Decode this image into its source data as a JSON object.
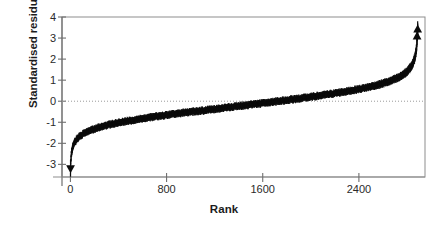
{
  "chart_data": {
    "type": "scatter",
    "title": "",
    "xlabel": "Rank",
    "ylabel": "Standardised residual",
    "xlim": [
      -70,
      2950
    ],
    "ylim": [
      -3.6,
      4.0
    ],
    "xticks": [
      0,
      800,
      1600,
      2400
    ],
    "xtick_labels": [
      "0",
      "800",
      "1600",
      "2400"
    ],
    "yticks": [
      4,
      3,
      2,
      1,
      0,
      -1,
      -2,
      -3
    ],
    "ytick_labels": [
      "4",
      "3",
      "2",
      "1",
      "0",
      "-1",
      "-2",
      "-3"
    ],
    "grid": false,
    "reference_line": {
      "y": 0,
      "style": "dotted",
      "color": "#9a9a9a"
    },
    "frame_color": "#8d8d8d",
    "marker_color": "#0b0b0b",
    "n_points": 2890,
    "series": [
      {
        "name": "Standardised residual",
        "marker": "point-with-error-bar",
        "x": [
          1,
          5,
          12,
          22,
          35,
          55,
          80,
          115,
          160,
          215,
          280,
          360,
          450,
          560,
          680,
          820,
          970,
          1130,
          1300,
          1480,
          1660,
          1840,
          2010,
          2170,
          2320,
          2450,
          2560,
          2660,
          2740,
          2800,
          2845,
          2868,
          2880,
          2886,
          2889
        ],
        "y": [
          -3.18,
          -2.72,
          -2.35,
          -2.12,
          -1.95,
          -1.78,
          -1.65,
          -1.52,
          -1.4,
          -1.28,
          -1.17,
          -1.06,
          -0.96,
          -0.86,
          -0.75,
          -0.64,
          -0.53,
          -0.42,
          -0.3,
          -0.18,
          -0.05,
          0.08,
          0.21,
          0.35,
          0.49,
          0.63,
          0.78,
          0.95,
          1.15,
          1.4,
          1.72,
          2.1,
          2.55,
          3.05,
          3.4
        ],
        "error": [
          0.22,
          0.2,
          0.19,
          0.18,
          0.17,
          0.17,
          0.16,
          0.16,
          0.16,
          0.16,
          0.16,
          0.16,
          0.16,
          0.16,
          0.16,
          0.16,
          0.16,
          0.16,
          0.16,
          0.16,
          0.16,
          0.16,
          0.16,
          0.16,
          0.16,
          0.16,
          0.17,
          0.17,
          0.18,
          0.19,
          0.2,
          0.22,
          0.24,
          0.26,
          0.28
        ]
      }
    ],
    "outliers": [
      {
        "rank": 1,
        "value": -3.18,
        "label": "lowest residual"
      },
      {
        "rank": 2884,
        "value": 3.07,
        "label": "high outlier"
      },
      {
        "rank": 2889,
        "value": 3.4,
        "label": "highest residual"
      }
    ]
  }
}
